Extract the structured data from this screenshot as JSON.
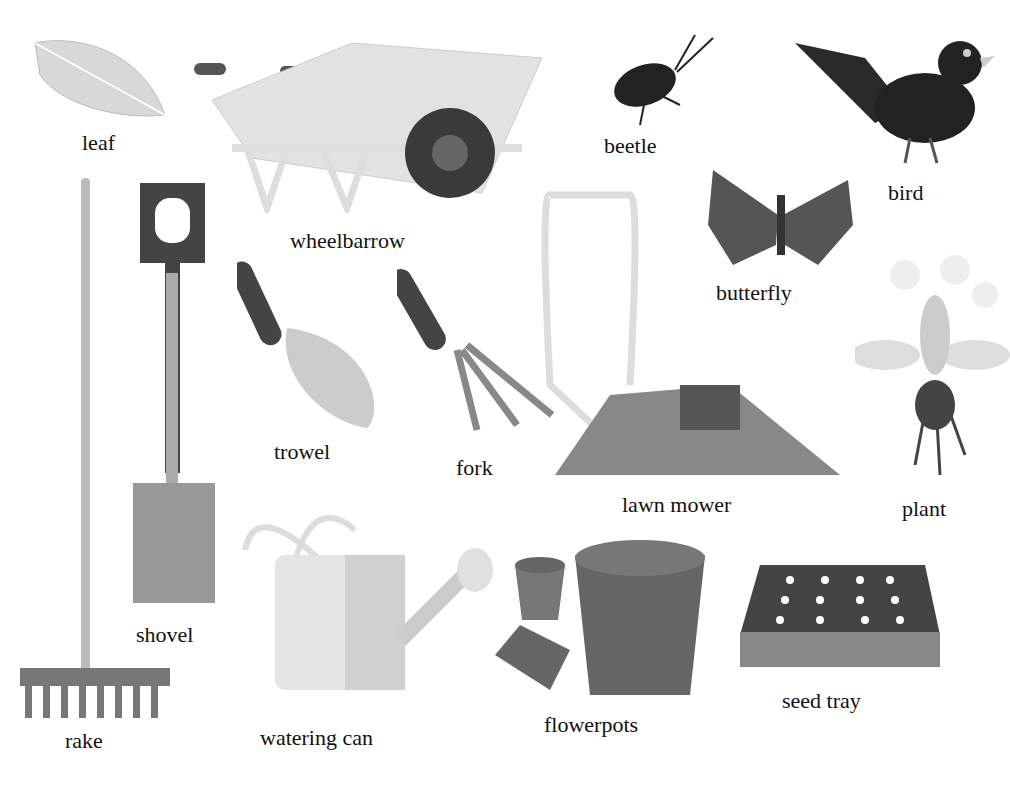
{
  "page": {
    "background": "#ffffff"
  },
  "items": [
    {
      "id": "leaf",
      "label": "leaf"
    },
    {
      "id": "wheelbarrow",
      "label": "wheelbarrow"
    },
    {
      "id": "beetle",
      "label": "beetle"
    },
    {
      "id": "bird",
      "label": "bird"
    },
    {
      "id": "butterfly",
      "label": "butterfly"
    },
    {
      "id": "shovel",
      "label": "shovel"
    },
    {
      "id": "rake",
      "label": "rake"
    },
    {
      "id": "trowel",
      "label": "trowel"
    },
    {
      "id": "fork",
      "label": "fork"
    },
    {
      "id": "lawn_mower",
      "label": "lawn mower"
    },
    {
      "id": "plant",
      "label": "plant"
    },
    {
      "id": "watering_can",
      "label": "watering can"
    },
    {
      "id": "flowerpots",
      "label": "flowerpots"
    },
    {
      "id": "seed_tray",
      "label": "seed tray"
    }
  ]
}
